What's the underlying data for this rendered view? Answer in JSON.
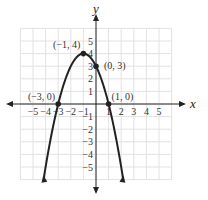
{
  "chart_data": {
    "type": "line",
    "title": "",
    "function": "y = -(x+1)^2 + 4",
    "xlabel": "x",
    "ylabel": "y",
    "xlim": [
      -6,
      6
    ],
    "ylim": [
      -6,
      6
    ],
    "grid": true,
    "x_ticks": [
      "−5",
      "−4",
      "−3",
      "−2",
      "−1",
      "1",
      "2",
      "3",
      "4",
      "5"
    ],
    "y_ticks": [
      "5",
      "4",
      "3",
      "2",
      "1",
      "−1",
      "−2",
      "−3",
      "−4",
      "−5"
    ],
    "points": [
      {
        "x": -1,
        "y": 4,
        "label": "(−1, 4)"
      },
      {
        "x": 0,
        "y": 3,
        "label": "(0, 3)"
      },
      {
        "x": -3,
        "y": 0,
        "label": "(−3, 0)"
      },
      {
        "x": 1,
        "y": 0,
        "label": "(1, 0)"
      }
    ]
  }
}
